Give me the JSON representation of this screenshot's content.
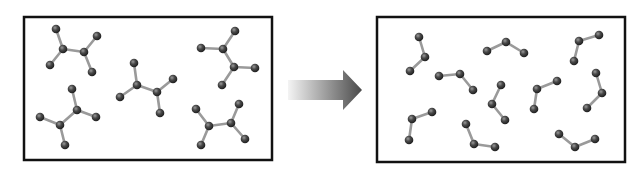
{
  "diagram": {
    "colors": {
      "background": "#ffffff",
      "box_border": "#111111",
      "bond": "#9a9a9a",
      "atom_dark": "#1e1e1e",
      "atom_mid": "#4a4a4a",
      "atom_highlight": "#9a9a9a",
      "arrow_start": "#f4f4f4",
      "arrow_end": "#4a4a4a"
    },
    "left_box": {
      "label": "reactants",
      "x": 24,
      "y": 17,
      "w": 248,
      "h": 143,
      "molecules": [
        {
          "atoms": [
            [
              63,
              49
            ],
            [
              84,
              52
            ],
            [
              56,
              29
            ],
            [
              50,
              65
            ],
            [
              97,
              36
            ],
            [
              92,
              72
            ]
          ],
          "bonds": [
            [
              0,
              1
            ],
            [
              0,
              2
            ],
            [
              0,
              3
            ],
            [
              1,
              4
            ],
            [
              1,
              5
            ]
          ]
        },
        {
          "atoms": [
            [
              137,
              85
            ],
            [
              157,
              92
            ],
            [
              134,
              63
            ],
            [
              120,
              97
            ],
            [
              173,
              79
            ],
            [
              160,
              113
            ]
          ],
          "bonds": [
            [
              0,
              1
            ],
            [
              0,
              2
            ],
            [
              0,
              3
            ],
            [
              1,
              4
            ],
            [
              1,
              5
            ]
          ]
        },
        {
          "atoms": [
            [
              223,
              49
            ],
            [
              234,
              67
            ],
            [
              235,
              31
            ],
            [
              201,
              48
            ],
            [
              255,
              68
            ],
            [
              222,
              85
            ]
          ],
          "bonds": [
            [
              0,
              1
            ],
            [
              0,
              2
            ],
            [
              0,
              3
            ],
            [
              1,
              4
            ],
            [
              1,
              5
            ]
          ]
        },
        {
          "atoms": [
            [
              77,
              110
            ],
            [
              60,
              125
            ],
            [
              72,
              89
            ],
            [
              96,
              117
            ],
            [
              40,
              117
            ],
            [
              65,
              145
            ]
          ],
          "bonds": [
            [
              0,
              1
            ],
            [
              0,
              2
            ],
            [
              0,
              3
            ],
            [
              1,
              4
            ],
            [
              1,
              5
            ]
          ]
        },
        {
          "atoms": [
            [
              209,
              126
            ],
            [
              231,
              123
            ],
            [
              196,
              109
            ],
            [
              201,
              145
            ],
            [
              239,
              104
            ],
            [
              245,
              139
            ]
          ],
          "bonds": [
            [
              0,
              1
            ],
            [
              0,
              2
            ],
            [
              0,
              3
            ],
            [
              1,
              4
            ],
            [
              1,
              5
            ]
          ]
        }
      ]
    },
    "arrow": {
      "label": "reaction-arrow",
      "x1": 288,
      "x2": 362,
      "cy": 90,
      "shaft_half_height": 10,
      "head_start": 343,
      "head_half_height": 20
    },
    "right_box": {
      "label": "products",
      "x": 377,
      "y": 17,
      "w": 248,
      "h": 145,
      "molecules": [
        {
          "atoms": [
            [
              419,
              37
            ],
            [
              425,
              57
            ],
            [
              410,
              71
            ]
          ]
        },
        {
          "atoms": [
            [
              487,
              51
            ],
            [
              506,
              42
            ],
            [
              524,
              53
            ]
          ]
        },
        {
          "atoms": [
            [
              599,
              35
            ],
            [
              579,
              41
            ],
            [
              574,
              61
            ]
          ]
        },
        {
          "atoms": [
            [
              439,
              76
            ],
            [
              460,
              74
            ],
            [
              473,
              90
            ]
          ]
        },
        {
          "atoms": [
            [
              501,
              85
            ],
            [
              492,
              104
            ],
            [
              505,
              120
            ]
          ]
        },
        {
          "atoms": [
            [
              557,
              81
            ],
            [
              537,
              89
            ],
            [
              534,
              109
            ]
          ]
        },
        {
          "atoms": [
            [
              596,
              73
            ],
            [
              602,
              93
            ],
            [
              587,
              108
            ]
          ]
        },
        {
          "atoms": [
            [
              432,
              112
            ],
            [
              412,
              119
            ],
            [
              409,
              140
            ]
          ]
        },
        {
          "atoms": [
            [
              466,
              124
            ],
            [
              474,
              144
            ],
            [
              495,
              147
            ]
          ]
        },
        {
          "atoms": [
            [
              559,
              134
            ],
            [
              575,
              147
            ],
            [
              595,
              139
            ]
          ]
        }
      ]
    }
  }
}
